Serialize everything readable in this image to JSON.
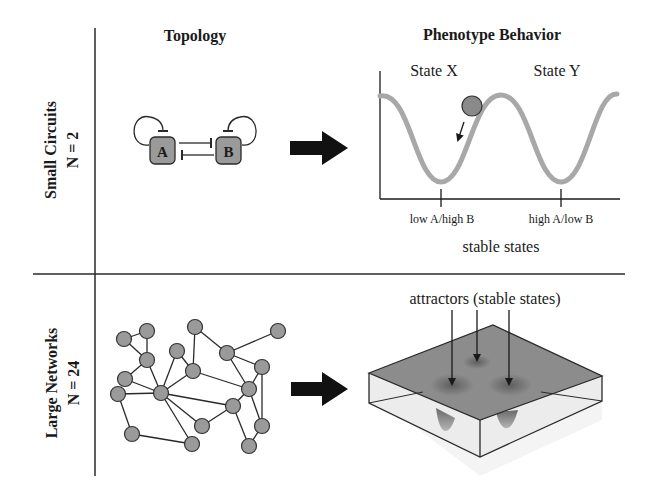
{
  "headers": {
    "topology": "Topology",
    "phenotype": "Phenotype Behavior"
  },
  "rows": [
    {
      "title": "Small Circuits",
      "subtitle": "N = 2"
    },
    {
      "title": "Large Networks",
      "subtitle": "N = 24"
    }
  ],
  "small_circuit": {
    "nodes": [
      "A",
      "B"
    ],
    "states": [
      "State X",
      "State Y"
    ],
    "tick_labels": [
      "low A/high B",
      "high A/low B"
    ],
    "xlabel": "stable states"
  },
  "large_network": {
    "attractor_label": "attractors (stable states)"
  },
  "colors": {
    "node_fill": "#9a9a9a",
    "curve": "#a8a8a8",
    "surface": "#8c8c8c",
    "line": "#2a2a2a"
  }
}
